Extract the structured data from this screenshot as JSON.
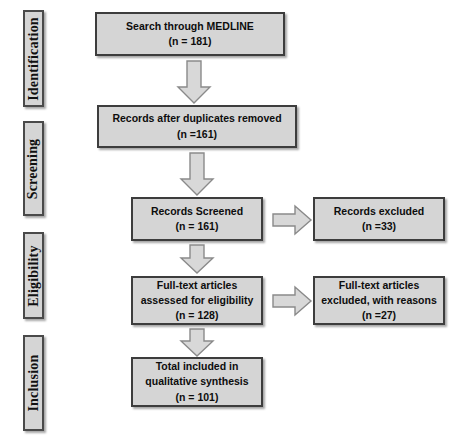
{
  "diagram": {
    "colors": {
      "box_fill": "#d5d5d5",
      "box_border": "#3d3d3d",
      "arrow_fill": "#d8d8d8",
      "arrow_border": "#8a8a8a",
      "background": "#ffffff",
      "text": "#0d0d0d"
    },
    "stages": [
      {
        "id": "identification",
        "label": "Identification"
      },
      {
        "id": "screening",
        "label": "Screening"
      },
      {
        "id": "eligibility",
        "label": "Eligibility"
      },
      {
        "id": "inclusion",
        "label": "Inclusion"
      }
    ],
    "nodes": [
      {
        "id": "search-medline",
        "stage": "identification",
        "lines": [
          "Search through MEDLINE",
          "(n = 181)"
        ],
        "count": 181
      },
      {
        "id": "records-after-duplicates-removed",
        "stage": "identification",
        "lines": [
          "Records after duplicates removed",
          "(n =161)"
        ],
        "count": 161
      },
      {
        "id": "records-screened",
        "stage": "screening",
        "lines": [
          "Records Screened",
          "(n = 161)"
        ],
        "count": 161
      },
      {
        "id": "records-excluded",
        "stage": "screening",
        "lines": [
          "Records excluded",
          "(n =33)"
        ],
        "count": 33
      },
      {
        "id": "fulltext-assessed",
        "stage": "eligibility",
        "lines": [
          "Full-text articles",
          "assessed for eligibility",
          "(n = 128)"
        ],
        "count": 128
      },
      {
        "id": "fulltext-excluded",
        "stage": "eligibility",
        "lines": [
          "Full-text articles",
          "excluded, with reasons",
          "(n =27)"
        ],
        "count": 27
      },
      {
        "id": "total-included",
        "stage": "inclusion",
        "lines": [
          "Total included in",
          "qualitative synthesis",
          "(n = 101)"
        ],
        "count": 101
      }
    ],
    "arrows": [
      {
        "id": "arrow-search-to-dedup",
        "direction": "down",
        "icon": "arrow-down-icon"
      },
      {
        "id": "arrow-dedup-to-screened",
        "direction": "down",
        "icon": "arrow-down-icon"
      },
      {
        "id": "arrow-screened-to-excluded",
        "direction": "right",
        "icon": "arrow-right-icon"
      },
      {
        "id": "arrow-screened-to-fulltext",
        "direction": "down",
        "icon": "arrow-down-icon"
      },
      {
        "id": "arrow-fulltext-to-excluded",
        "direction": "right",
        "icon": "arrow-right-icon"
      },
      {
        "id": "arrow-fulltext-to-included",
        "direction": "down",
        "icon": "arrow-down-icon"
      }
    ]
  }
}
